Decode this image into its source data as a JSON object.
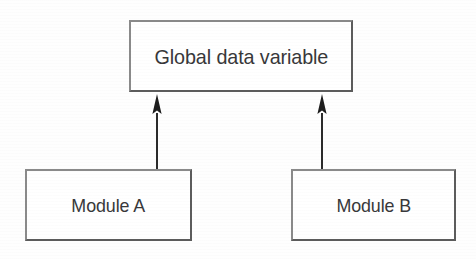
{
  "diagram": {
    "type": "block-diagram",
    "canvas": {
      "width": 476,
      "height": 259,
      "background": "#fefefe"
    },
    "style": {
      "box_border_color": "#6e6e6e",
      "box_fill_color": "#ffffff",
      "text_color": "#38383a",
      "arrow_color": "#2b2b2b"
    },
    "nodes": [
      {
        "id": "global",
        "label": "Global data variable",
        "x": 129,
        "y": 20,
        "width": 224,
        "height": 72
      },
      {
        "id": "module-a",
        "label": "Module A",
        "x": 25,
        "y": 169,
        "width": 167,
        "height": 72
      },
      {
        "id": "module-b",
        "label": "Module B",
        "x": 291,
        "y": 169,
        "width": 165,
        "height": 72
      }
    ],
    "connectors": [
      {
        "id": "arrow-a",
        "from": "module-a",
        "to": "global",
        "direction": "up",
        "head": "solid-triangle"
      },
      {
        "id": "arrow-b",
        "from": "module-b",
        "to": "global",
        "direction": "up",
        "head": "solid-triangle"
      }
    ]
  }
}
